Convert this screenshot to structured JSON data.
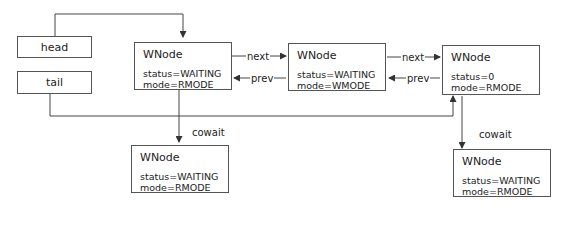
{
  "pointers": {
    "head": "head",
    "tail": "tail"
  },
  "nodes": [
    {
      "title": "WNode",
      "status": "status=WAITING",
      "mode": "mode=RMODE"
    },
    {
      "title": "WNode",
      "status": "status=WAITING",
      "mode": "mode=WMODE"
    },
    {
      "title": "WNode",
      "status": "status=0",
      "mode": "mode=RMODE"
    },
    {
      "title": "WNode",
      "status": "status=WAITING",
      "mode": "mode=RMODE"
    },
    {
      "title": "WNode",
      "status": "status=WAITING",
      "mode": "mode=RMODE"
    }
  ],
  "edges": {
    "next1": "next",
    "prev1": "prev",
    "next2": "next",
    "prev2": "prev",
    "cowait1": "cowait",
    "cowait2": "cowait"
  },
  "colors": {
    "line": "#444444",
    "border": "#555555"
  }
}
